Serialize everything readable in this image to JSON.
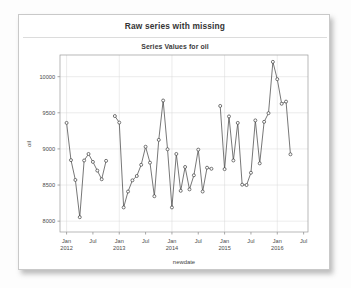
{
  "card": {
    "title": "Raw series with missing",
    "subtitle": "Series Values for oil"
  },
  "chart_data": {
    "type": "line",
    "title": "Raw series with missing",
    "subtitle": "Series Values for oil",
    "xlabel": "newdate",
    "ylabel": "oil",
    "ylim": [
      7850,
      10300
    ],
    "xlim": [
      "2011-11-15",
      "2016-07-15"
    ],
    "grid": true,
    "legend": false,
    "marker": "open-circle",
    "ytick_values": [
      8000,
      8500,
      9000,
      9500,
      10000
    ],
    "ytick_labels": [
      "8000",
      "8500",
      "9000",
      "9500",
      "10000"
    ],
    "xtick_labels": [
      "Jan\n2012",
      "Jul",
      "Jan\n2013",
      "Jul",
      "Jan\n2014",
      "Jul",
      "Jan\n2015",
      "Jul",
      "Jan\n2016",
      "Jul"
    ],
    "xtick_positions": [
      "2012-01",
      "2012-07",
      "2013-01",
      "2013-07",
      "2014-01",
      "2014-07",
      "2015-01",
      "2015-07",
      "2016-01",
      "2016-07"
    ],
    "series": [
      {
        "name": "oil",
        "has_missing": true,
        "points": [
          {
            "x": "2012-01",
            "y": 9360
          },
          {
            "x": "2012-02",
            "y": 8845
          },
          {
            "x": "2012-03",
            "y": 8570
          },
          {
            "x": "2012-04",
            "y": 8055
          },
          {
            "x": "2012-05",
            "y": 8840
          },
          {
            "x": "2012-06",
            "y": 8930
          },
          {
            "x": "2012-07",
            "y": 8820
          },
          {
            "x": "2012-08",
            "y": 8700
          },
          {
            "x": "2012-09",
            "y": 8580
          },
          {
            "x": "2012-10",
            "y": 8835
          },
          {
            "x": "2012-12",
            "y": 9455
          },
          {
            "x": "2013-01",
            "y": 9365
          },
          {
            "x": "2013-02",
            "y": 8190
          },
          {
            "x": "2013-03",
            "y": 8410
          },
          {
            "x": "2013-04",
            "y": 8565
          },
          {
            "x": "2013-05",
            "y": 8625
          },
          {
            "x": "2013-06",
            "y": 8780
          },
          {
            "x": "2013-07",
            "y": 9030
          },
          {
            "x": "2013-08",
            "y": 8810
          },
          {
            "x": "2013-09",
            "y": 8345
          },
          {
            "x": "2013-10",
            "y": 9125
          },
          {
            "x": "2013-11",
            "y": 9670
          },
          {
            "x": "2013-12",
            "y": 8995
          },
          {
            "x": "2014-01",
            "y": 8190
          },
          {
            "x": "2014-02",
            "y": 8930
          },
          {
            "x": "2014-03",
            "y": 8420
          },
          {
            "x": "2014-04",
            "y": 8750
          },
          {
            "x": "2014-05",
            "y": 8440
          },
          {
            "x": "2014-06",
            "y": 8635
          },
          {
            "x": "2014-07",
            "y": 8990
          },
          {
            "x": "2014-08",
            "y": 8410
          },
          {
            "x": "2014-09",
            "y": 8740
          },
          {
            "x": "2014-10",
            "y": 8725
          },
          {
            "x": "2014-12",
            "y": 9595
          },
          {
            "x": "2015-01",
            "y": 8720
          },
          {
            "x": "2015-02",
            "y": 9450
          },
          {
            "x": "2015-03",
            "y": 8840
          },
          {
            "x": "2015-04",
            "y": 9360
          },
          {
            "x": "2015-05",
            "y": 8505
          },
          {
            "x": "2015-06",
            "y": 8500
          },
          {
            "x": "2015-07",
            "y": 8670
          },
          {
            "x": "2015-08",
            "y": 9395
          },
          {
            "x": "2015-09",
            "y": 8800
          },
          {
            "x": "2015-10",
            "y": 9375
          },
          {
            "x": "2015-11",
            "y": 9495
          },
          {
            "x": "2015-12",
            "y": 10205
          },
          {
            "x": "2016-01",
            "y": 9965
          },
          {
            "x": "2016-02",
            "y": 9625
          },
          {
            "x": "2016-03",
            "y": 9655
          },
          {
            "x": "2016-04",
            "y": 8925
          }
        ]
      }
    ]
  }
}
